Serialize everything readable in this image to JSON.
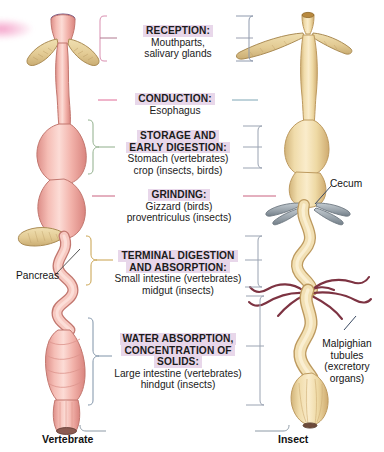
{
  "figure": {
    "background": "#ffffff",
    "highlight_color": "#e8d7ea"
  },
  "center_labels": [
    {
      "id": "reception",
      "heading": "RECEPTION:",
      "lines": [
        "Mouthparts,",
        "salivary glands"
      ],
      "bracket_color": "#d98fb0"
    },
    {
      "id": "conduction",
      "heading": "CONDUCTION:",
      "lines": [
        "Esophagus"
      ],
      "bracket_color": "#e06a96"
    },
    {
      "id": "storage",
      "heading": "STORAGE AND EARLY DIGESTION:",
      "heading_lines": [
        "STORAGE AND",
        "EARLY DIGESTION:"
      ],
      "lines": [
        "Stomach (vertebrates)",
        "crop (insects, birds)"
      ],
      "bracket_color": "#8fae8a"
    },
    {
      "id": "grinding",
      "heading": "GRINDING:",
      "lines": [
        "Gizzard (birds)",
        "proventriculus (insects)"
      ],
      "bracket_color": "#c9607f"
    },
    {
      "id": "terminal-digestion",
      "heading": "TERMINAL DIGESTION AND ABSORPTION:",
      "heading_lines": [
        "TERMINAL DIGESTION",
        "AND ABSORPTION:"
      ],
      "lines": [
        "Small intestine (vertebrates)",
        "midgut (insects)"
      ],
      "bracket_color": "#c8a04a"
    },
    {
      "id": "water-absorption",
      "heading": "WATER ABSORPTION, CONCENTRATION OF SOLIDS:",
      "heading_lines": [
        "WATER ABSORPTION,",
        "CONCENTRATION OF",
        "SOLIDS:"
      ],
      "lines": [
        "Large intestine (vertebrates)",
        "hindgut (insects)"
      ],
      "bracket_color": "#7f93a8"
    }
  ],
  "callouts": [
    {
      "id": "pancreas",
      "text": "Pancreas",
      "side": "left"
    },
    {
      "id": "cecum",
      "text": "Cecum",
      "side": "right"
    },
    {
      "id": "malpighian",
      "lines": [
        "Malpighian",
        "tubules",
        "(excretory",
        "organs)"
      ],
      "side": "right"
    }
  ],
  "species": [
    {
      "id": "vertebrate",
      "name": "Vertebrate"
    },
    {
      "id": "insect",
      "name": "Insect"
    }
  ],
  "anatomy": {
    "vertebrate": {
      "tract_color": "#f3b3ab",
      "tract_shadow": "#e08c86",
      "gland_color": "#e5cf9a",
      "mouth_color": "#8f6fa8",
      "parts": [
        "mouth",
        "salivary-glands",
        "esophagus",
        "stomach",
        "pancreas",
        "small-intestine",
        "large-intestine",
        "anus"
      ]
    },
    "insect": {
      "tract_color": "#f0dcab",
      "tract_shadow": "#d4b87c",
      "cecum_color": "#9aa4ab",
      "malpighian_color": "#7d3342",
      "mouth_color": "#b8893f",
      "parts": [
        "mouthparts",
        "salivary-glands",
        "esophagus",
        "crop",
        "gizzard",
        "cecum",
        "midgut",
        "malpighian-tubules",
        "hindgut",
        "rectum"
      ]
    }
  }
}
